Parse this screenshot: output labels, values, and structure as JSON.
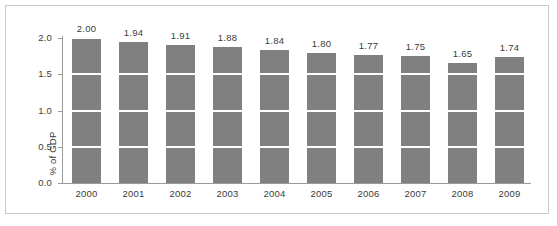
{
  "figure": {
    "background_color": "#ffffff",
    "border_color": "#c9c9c9",
    "axis_color": "#9a9a9a",
    "text_color": "#3b3b3b",
    "bar_color": "#808080",
    "gridline_color": "#ffffff"
  },
  "chart_data": {
    "type": "bar",
    "title": "",
    "subtitle": "",
    "xlabel": "",
    "ylabel": "% of GDP",
    "categories": [
      "2000",
      "2001",
      "2002",
      "2003",
      "2004",
      "2005",
      "2006",
      "2007",
      "2008",
      "2009"
    ],
    "values": [
      2.0,
      1.94,
      1.91,
      1.88,
      1.84,
      1.8,
      1.77,
      1.75,
      1.65,
      1.74
    ],
    "data_labels": [
      "2.00",
      "1.94",
      "1.91",
      "1.88",
      "1.84",
      "1.80",
      "1.77",
      "1.75",
      "1.65",
      "1.74"
    ],
    "ylim": [
      0.0,
      2.0
    ],
    "ytick_values": [
      0.0,
      0.5,
      1.0,
      1.5,
      2.0
    ],
    "ytick_labels": [
      "0.0",
      "0.5",
      "1.0",
      "1.5",
      "2.0"
    ],
    "grid": "horizontal-white-over-bars",
    "gridline_values": [
      0.5,
      1.0,
      1.5,
      2.0
    ],
    "legend": "none",
    "legend_position": "none",
    "series": [
      {
        "name": "% of GDP",
        "color": "#808080",
        "values": [
          2.0,
          1.94,
          1.91,
          1.88,
          1.84,
          1.8,
          1.77,
          1.75,
          1.65,
          1.74
        ]
      }
    ]
  }
}
